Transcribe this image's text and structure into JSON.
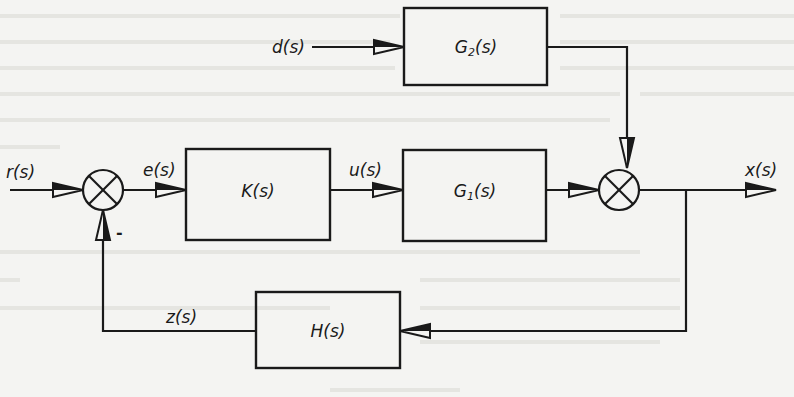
{
  "diagram": {
    "type": "control-system-block-diagram",
    "blocks": {
      "controller": {
        "label": "K(s)",
        "main": "K",
        "arg": "(s)"
      },
      "plant": {
        "label": "G1(s)",
        "main": "G",
        "sub": "1",
        "arg": "(s)"
      },
      "disturbance_filter": {
        "label": "G2(s)",
        "main": "G",
        "sub": "2",
        "arg": "(s)"
      },
      "feedback": {
        "label": "H(s)",
        "main": "H",
        "arg": "(s)"
      }
    },
    "signals": {
      "reference": "r(s)",
      "error": "e(s)",
      "control": "u(s)",
      "disturbance": "d(s)",
      "output": "x(s)",
      "feedback": "z(s)"
    },
    "summing_junctions": [
      {
        "id": "sum1",
        "inputs": [
          "r(s) (+)",
          "z(s) (-)"
        ],
        "output": "e(s)",
        "sign_label": "-"
      },
      {
        "id": "sum2",
        "inputs": [
          "G1 output (+)",
          "G2 output (+)"
        ],
        "output": "x(s)"
      }
    ],
    "connections": [
      {
        "from": "r(s)",
        "to": "sum1"
      },
      {
        "from": "sum1",
        "to": "K(s)",
        "signal": "e(s)"
      },
      {
        "from": "K(s)",
        "to": "G1(s)",
        "signal": "u(s)"
      },
      {
        "from": "G1(s)",
        "to": "sum2"
      },
      {
        "from": "d(s)",
        "to": "G2(s)"
      },
      {
        "from": "G2(s)",
        "to": "sum2"
      },
      {
        "from": "sum2",
        "to": "x(s)"
      },
      {
        "from": "x(s)",
        "to": "H(s)"
      },
      {
        "from": "H(s)",
        "to": "sum1",
        "signal": "z(s)"
      }
    ]
  }
}
